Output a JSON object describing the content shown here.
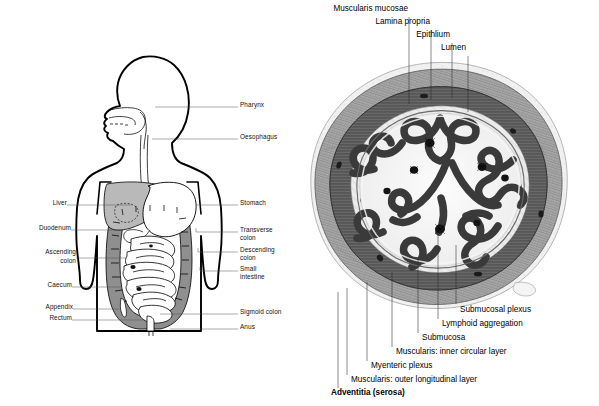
{
  "figure": {
    "background": "#ffffff",
    "ink": "#000000"
  },
  "panels": {
    "left": {
      "name": "whole-body-digestive-tract",
      "labels_left": [
        {
          "text": "Liver",
          "x": 47,
          "y": 202,
          "lx1": 67,
          "lx2": 131,
          "ly": 205
        },
        {
          "text": "Duodenum",
          "x": 25,
          "y": 227,
          "lx1": 71,
          "lx2": 123,
          "ly": 230
        },
        {
          "text": "Ascending",
          "x": 28,
          "y": 251,
          "lx1": 76,
          "lx2": 126,
          "ly": 258
        },
        {
          "text": "colon",
          "x": 45,
          "y": 261,
          "lx1": 0,
          "lx2": 0,
          "ly": 0
        },
        {
          "text": "Caecum",
          "x": 35,
          "y": 284,
          "lx1": 72,
          "lx2": 121,
          "ly": 287
        },
        {
          "text": "Appendix",
          "x": 29,
          "y": 306,
          "lx1": 73,
          "lx2": 119,
          "ly": 309
        },
        {
          "text": "Rectum",
          "x": 35,
          "y": 317,
          "lx1": 72,
          "lx2": 143,
          "ly": 320
        }
      ],
      "labels_right": [
        {
          "text": "Pharynx",
          "x": 240,
          "y": 104,
          "lx1": 155,
          "lx2": 238,
          "ly": 107
        },
        {
          "text": "Oesophagus",
          "x": 240,
          "y": 136,
          "lx1": 152,
          "lx2": 238,
          "ly": 139
        },
        {
          "text": "Stomach",
          "x": 240,
          "y": 202,
          "lx1": 196,
          "lx2": 238,
          "ly": 205
        },
        {
          "text": "Transverse",
          "x": 240,
          "y": 228,
          "lx1": 196,
          "lx2": 238,
          "ly": 232
        },
        {
          "text": "colon",
          "x": 240,
          "y": 236,
          "lx1": 0,
          "lx2": 0,
          "ly": 0
        },
        {
          "text": "Descending",
          "x": 240,
          "y": 249,
          "lx1": 198,
          "lx2": 238,
          "ly": 252
        },
        {
          "text": "colon",
          "x": 240,
          "y": 257,
          "lx1": 0,
          "lx2": 0,
          "ly": 0
        },
        {
          "text": "Small",
          "x": 240,
          "y": 268,
          "lx1": 200,
          "lx2": 238,
          "ly": 271
        },
        {
          "text": "intestine",
          "x": 240,
          "y": 276,
          "lx1": 0,
          "lx2": 0,
          "ly": 0
        },
        {
          "text": "Sigmoid colon",
          "x": 240,
          "y": 311,
          "lx1": 160,
          "lx2": 238,
          "ly": 314
        },
        {
          "text": "Anus",
          "x": 240,
          "y": 326,
          "lx1": 170,
          "lx2": 238,
          "ly": 329
        }
      ]
    },
    "right": {
      "name": "intestinal-wall-cross-section",
      "labels_top": [
        {
          "text": "Muscularis mucosae",
          "tx": 404,
          "ty": 7,
          "lx": 409,
          "ly1": 17,
          "ly2": 104
        },
        {
          "text": "Lamina propria",
          "tx": 427,
          "ty": 20,
          "lx": 431,
          "ly1": 30,
          "ly2": 100
        },
        {
          "text": "Epithlium",
          "tx": 447,
          "ty": 33,
          "lx": 452,
          "ly1": 43,
          "ly2": 98
        },
        {
          "text": "Lumen",
          "tx": 463,
          "ty": 46,
          "lx": 468,
          "ly1": 56,
          "ly2": 110
        }
      ],
      "labels_bottom": [
        {
          "text": "Submucosal plexus",
          "tx": 461,
          "ty": 310,
          "lx": 456,
          "ly1": 304,
          "ly2": 245
        },
        {
          "text": "Lymphoid aggregation",
          "tx": 443,
          "ty": 324,
          "lx": 438,
          "ly1": 319,
          "ly2": 232
        },
        {
          "text": "Submucosa",
          "tx": 423,
          "ty": 338,
          "lx": 418,
          "ly1": 333,
          "ly2": 258
        },
        {
          "text": "Muscularis: inner circular layer",
          "tx": 397,
          "ty": 352,
          "lx": 392,
          "ly1": 347,
          "ly2": 272
        },
        {
          "text": "Myenteric plexus",
          "tx": 372,
          "ty": 366,
          "lx": 367,
          "ly1": 361,
          "ly2": 282
        },
        {
          "text": "Muscularis: outer longitudinal layer",
          "tx": 352,
          "ty": 380,
          "lx": 347,
          "ly1": 375,
          "ly2": 288
        },
        {
          "text": "Adventitia (serosa)",
          "tx": 332,
          "ty": 393,
          "lx": 338,
          "ly1": 388,
          "ly2": 292,
          "bold": true
        }
      ]
    }
  }
}
